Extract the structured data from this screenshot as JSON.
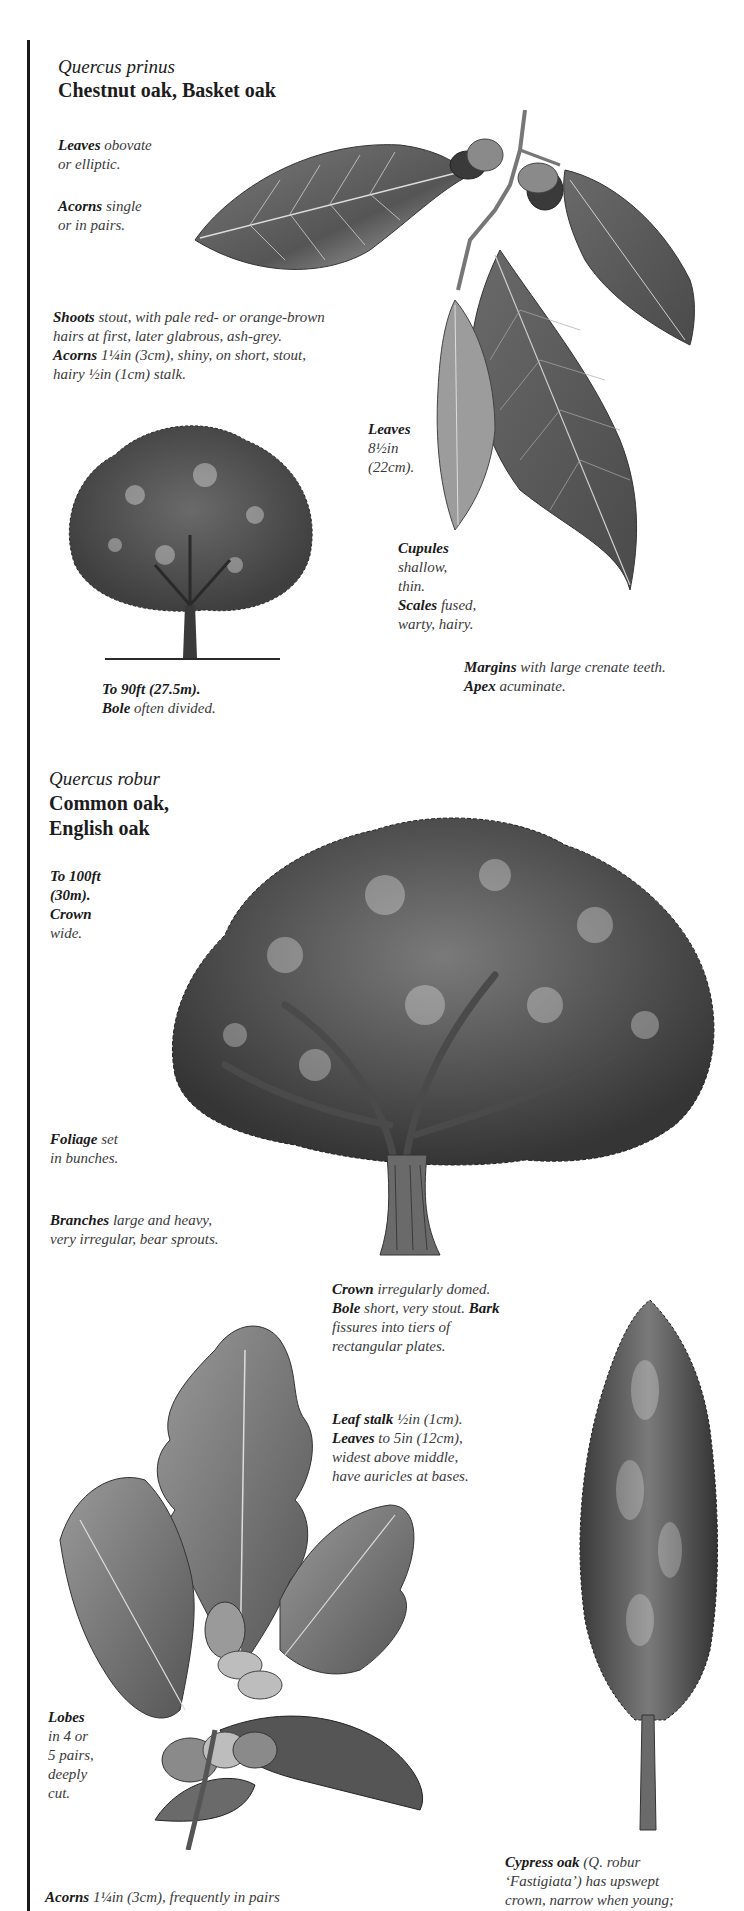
{
  "species": [
    {
      "scientific_name": "Quercus prinus",
      "common_name": "Chestnut oak, Basket oak",
      "notes": [
        {
          "term": "Leaves",
          "text": " obovate",
          "text2": "or elliptic."
        },
        {
          "term": "Acorns",
          "text": " single",
          "text2": "or in pairs."
        },
        {
          "term": "Shoots",
          "text": " stout, with pale red- or orange-brown",
          "text2": "hairs at first, later glabrous, ash-grey."
        },
        {
          "term": "Acorns",
          "text": " 1¼in (3cm), shiny, on short, stout,",
          "text2": "hairy ½in (1cm) stalk."
        },
        {
          "term": "Leaves",
          "text": "",
          "text2": "8½in",
          "text3": "(22cm)."
        },
        {
          "term": "Cupules",
          "text": "",
          "text2": "shallow,",
          "text3": "thin."
        },
        {
          "term": "Scales",
          "text": " fused,",
          "text2": "warty, hairy."
        },
        {
          "term": "To 90ft (27.5m).",
          "text": ""
        },
        {
          "term": "Bole",
          "text": " often divided."
        },
        {
          "term": "Margins",
          "text": " with large crenate teeth."
        },
        {
          "term": "Apex",
          "text": " acuminate."
        }
      ]
    },
    {
      "scientific_name": "Quercus robur",
      "common_name_line1": "Common oak,",
      "common_name_line2": "English oak",
      "notes": [
        {
          "term": "To 100ft",
          "text2": "(30m)."
        },
        {
          "term": "Crown",
          "text2": "wide."
        },
        {
          "term": "Foliage",
          "text": " set",
          "text2": "in bunches."
        },
        {
          "term": "Branches",
          "text": " large and heavy,",
          "text2": "very irregular, bear sprouts."
        },
        {
          "term": "Crown",
          "text": " irregularly domed."
        },
        {
          "term": "Bole",
          "text": " short, very stout. ",
          "term2": "Bark",
          "text2": "fissures into tiers of",
          "text3": "rectangular plates."
        },
        {
          "term": "Leaf stalk",
          "text": " ½in (1cm)."
        },
        {
          "term": "Leaves",
          "text": " to 5in (12cm),",
          "text2": "widest above middle,",
          "text3": "have auricles at bases."
        },
        {
          "term": "Lobes",
          "text2": "in 4 or",
          "text3": "5 pairs,",
          "text4": "deeply",
          "text5": "cut."
        },
        {
          "term": "Acorns",
          "text": " 1¼in (3cm), frequently in pairs"
        },
        {
          "term": "Cypress oak",
          "text": " (Q. robur",
          "text2": "‘Fastigiata’) has upswept",
          "text3": "crown, narrow when young;"
        }
      ]
    }
  ],
  "illustrations": [
    {
      "name": "chestnut-oak-leaf-sprig",
      "caption": ""
    },
    {
      "name": "chestnut-oak-tree",
      "caption": ""
    },
    {
      "name": "common-oak-tree",
      "caption": ""
    },
    {
      "name": "common-oak-leaf-sprig",
      "caption": ""
    },
    {
      "name": "cypress-oak-tree",
      "caption": ""
    }
  ]
}
